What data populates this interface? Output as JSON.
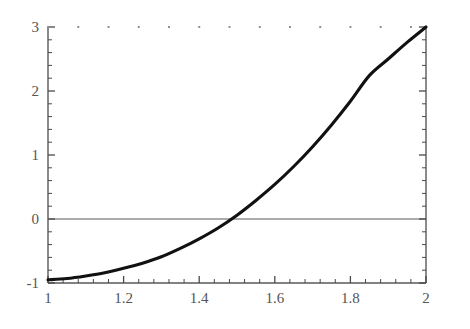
{
  "figure": {
    "background_color": "#ffffff",
    "axis_color": "#595959",
    "curve_color": "#111111",
    "tick_label_color": "#555555",
    "top_dot_color": "#8d8d8d"
  },
  "chart_data": {
    "type": "line",
    "title": "",
    "subtitle": "",
    "xlabel": "",
    "ylabel": "",
    "xlim": [
      1,
      2
    ],
    "ylim": [
      -1,
      3
    ],
    "grid": false,
    "legend": null,
    "annotations": [],
    "x_ticks": [
      {
        "value": 1,
        "label": "1"
      },
      {
        "value": 1.2,
        "label": "1.2"
      },
      {
        "value": 1.4,
        "label": "1.4"
      },
      {
        "value": 1.6,
        "label": "1.6"
      },
      {
        "value": 1.8,
        "label": "1.8"
      },
      {
        "value": 2,
        "label": "2"
      }
    ],
    "y_ticks": [
      {
        "value": -1,
        "label": "-1"
      },
      {
        "value": 0,
        "label": "0"
      },
      {
        "value": 1,
        "label": "1"
      },
      {
        "value": 2,
        "label": "2"
      },
      {
        "value": 3,
        "label": "3"
      }
    ],
    "x_minor_tick_count_between_majors": 4,
    "y_minor_tick_count_between_majors": 4,
    "zero_line": {
      "value": 0,
      "visible": true
    },
    "zero_crossing_x": 1.52,
    "series": [
      {
        "name": "curve",
        "linewidth": 3.1,
        "color": "#111111",
        "x": [
          1.0,
          1.05,
          1.1,
          1.15,
          1.2,
          1.25,
          1.3,
          1.35,
          1.4,
          1.45,
          1.5,
          1.55,
          1.6,
          1.65,
          1.7,
          1.75,
          1.8,
          1.85,
          1.9,
          1.95,
          2.0
        ],
        "y": [
          -0.95,
          -0.93,
          -0.89,
          -0.84,
          -0.77,
          -0.69,
          -0.59,
          -0.46,
          -0.31,
          -0.14,
          0.06,
          0.29,
          0.54,
          0.82,
          1.13,
          1.47,
          1.84,
          2.24,
          2.5,
          2.76,
          3.0
        ]
      }
    ]
  },
  "geometry": {
    "plot_left": 48,
    "plot_right": 426,
    "plot_top": 27,
    "plot_bottom": 283,
    "x_tick_label_y": 303,
    "top_dot_row_y": 27
  }
}
